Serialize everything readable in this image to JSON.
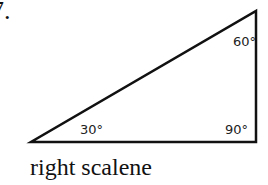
{
  "question": {
    "number": "7."
  },
  "triangle": {
    "vertices": {
      "bottom_left": [
        31,
        142
      ],
      "bottom_right": [
        256,
        142
      ],
      "top_right": [
        256,
        11
      ]
    },
    "stroke_color": "#111111",
    "angles": {
      "top_right": "60°",
      "bottom_left": "30°",
      "bottom_right": "90°"
    }
  },
  "caption": "right scalene"
}
